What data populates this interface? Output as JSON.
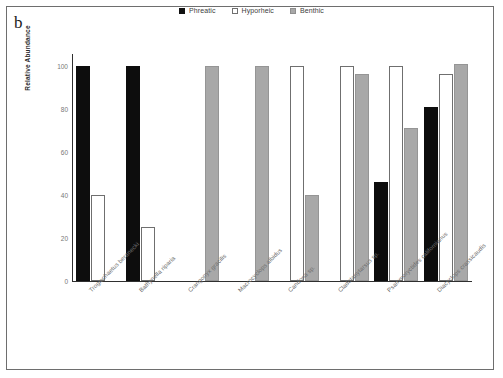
{
  "figure": {
    "panel_label": "b"
  },
  "legend": {
    "position": "top-center",
    "entries": [
      {
        "label": "Phreatic",
        "color": "#0d0d0d",
        "icon": "square-filled-icon"
      },
      {
        "label": "Hyporheic",
        "color": "#ffffff",
        "icon": "square-outline-icon"
      },
      {
        "label": "Benthic",
        "color": "#a8a8a8",
        "icon": "square-gray-icon"
      }
    ]
  },
  "axes": {
    "ylabel": "Relative Abundance",
    "yticks": [
      "0",
      "20",
      "40",
      "60",
      "80",
      "100"
    ]
  },
  "chart_data": {
    "type": "bar",
    "title": "",
    "xlabel": "",
    "ylabel": "Relative Abundance",
    "ylim": [
      0,
      105
    ],
    "yticks": [
      0,
      20,
      40,
      60,
      80,
      100
    ],
    "grid": false,
    "legend_position": "top-center",
    "categories": [
      "Troglochaetus beranecki",
      "Bathynella riparia",
      "Crangonyx gracilis",
      "Macrocyclops albidus",
      "Candona sp.",
      "Cladotanytarsus sp.",
      "Psammoryctides californianus",
      "Diacyclops crassicaudis"
    ],
    "series": [
      {
        "name": "Phreatic",
        "color": "#0d0d0d",
        "values": [
          100,
          100,
          0,
          0,
          0,
          0,
          46,
          81
        ]
      },
      {
        "name": "Hyporheic",
        "color": "#ffffff",
        "values": [
          40,
          25,
          0,
          0,
          100,
          100,
          100,
          96
        ]
      },
      {
        "name": "Benthic",
        "color": "#a8a8a8",
        "values": [
          0,
          0,
          100,
          100,
          40,
          96,
          71,
          101
        ]
      }
    ]
  }
}
